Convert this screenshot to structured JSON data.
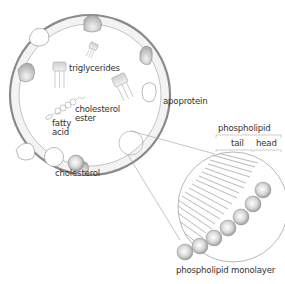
{
  "diagram": {
    "labels": {
      "triglycerides": "triglycerides",
      "cholesterol_ester_1": "cholesterol",
      "cholesterol_ester_2": "ester",
      "fatty_acid_1": "fatty",
      "fatty_acid_2": "acid",
      "cholesterol": "cholesterol",
      "apoprotein": "apoprotein",
      "phospholipid": "phospholipid",
      "tail": "tail",
      "head": "head",
      "phospholipid_monolayer": "phospholipid monolayer"
    },
    "colors": {
      "outline": "#8a8a8a",
      "shell_fill": "#f2f2f2",
      "text": "#333333",
      "sphere_dark": "#9a9a9a",
      "sphere_light": "#ffffff"
    }
  }
}
